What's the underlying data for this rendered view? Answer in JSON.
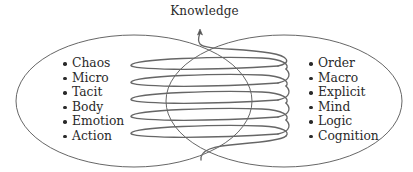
{
  "diagram": {
    "title": "Knowledge",
    "left_set": {
      "items": [
        "Chaos",
        "Micro",
        "Tacit",
        "Body",
        "Emotion",
        "Action"
      ]
    },
    "right_set": {
      "items": [
        "Order",
        "Macro",
        "Explicit",
        "Mind",
        "Logic",
        "Cognition"
      ]
    },
    "spiral": {
      "coil_count": 5,
      "direction": "upward",
      "arrow_target": "Knowledge"
    },
    "colors": {
      "line": "#555555",
      "text": "#2a2a2a",
      "background": "#ffffff"
    }
  }
}
